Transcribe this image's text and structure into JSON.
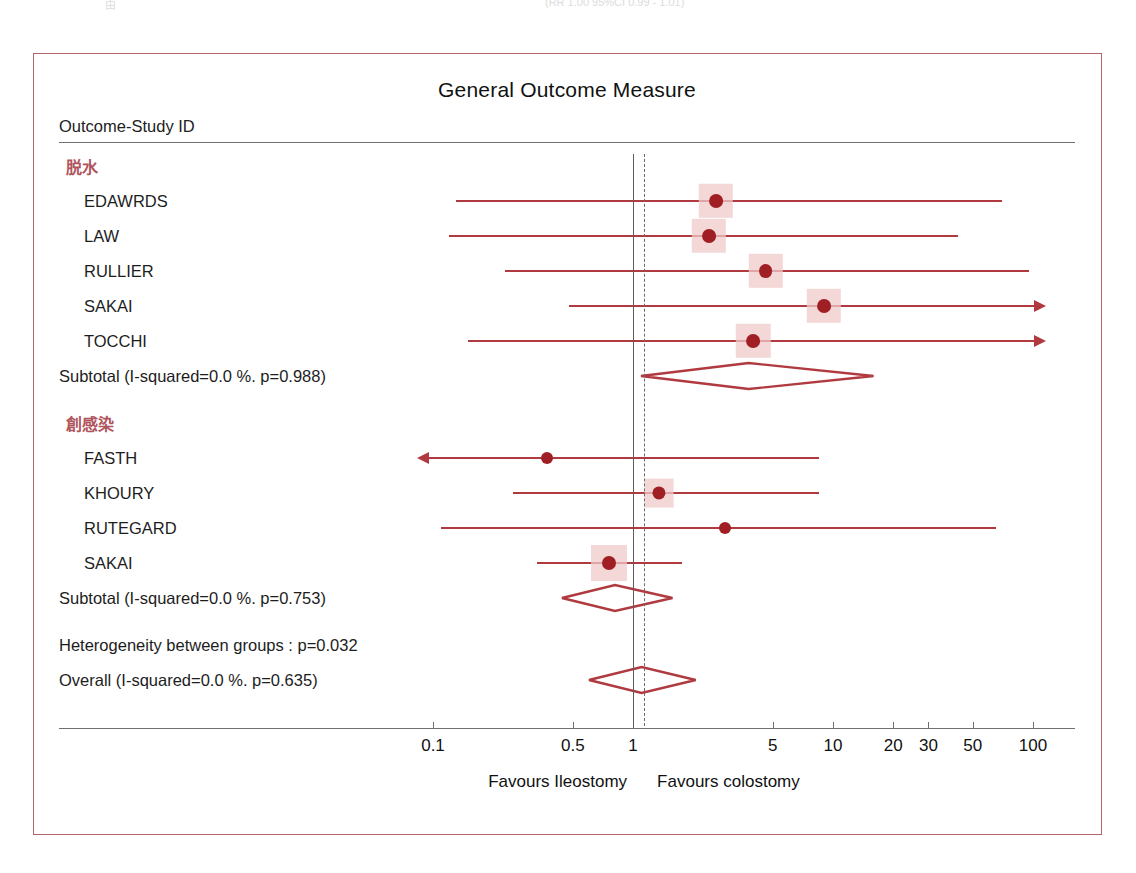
{
  "scan_artifacts": {
    "top_left_fragment": "由",
    "top_right_fragment": "(RR 1.00  95%CI 0.99 - 1.01)"
  },
  "figure": {
    "title": "General Outcome Measure",
    "column_header": "Outcome-Study ID",
    "left_caption": "Favours Ileostomy",
    "right_caption": "Favours colostomy",
    "accent_color": "#b03a3f",
    "group_label_color": "#b0545c",
    "frame_color": "#b5656a",
    "marker_box_color": "#f0c9ca",
    "point_color": "#a01f24"
  },
  "chart_data": {
    "type": "forest",
    "title": "General Outcome Measure",
    "xlabel": "",
    "ylabel": "Outcome-Study ID",
    "xscale": "log",
    "xlim": [
      0.08,
      130
    ],
    "grid": false,
    "null_value": 1,
    "pooled_reference": 1.13,
    "tick_values": [
      0.1,
      0.5,
      1,
      5,
      10,
      20,
      30,
      50,
      100
    ],
    "tick_labels": [
      "0.1",
      "0.5",
      "1",
      "5",
      "10",
      "20",
      "30",
      "50",
      "100"
    ],
    "left_caption": "Favours Ileostomy",
    "right_caption": "Favours colostomy",
    "groups": [
      {
        "label": "脱水",
        "studies": [
          {
            "name": "EDAWRDS",
            "estimate": 2.6,
            "lower": 0.13,
            "upper": 70.0,
            "weight": 0.9,
            "arrow_left": false,
            "arrow_right": false
          },
          {
            "name": "LAW",
            "estimate": 2.4,
            "lower": 0.12,
            "upper": 42.0,
            "weight": 0.9,
            "arrow_left": false,
            "arrow_right": false
          },
          {
            "name": "RULLIER",
            "estimate": 4.6,
            "lower": 0.23,
            "upper": 95.0,
            "weight": 0.9,
            "arrow_left": false,
            "arrow_right": false
          },
          {
            "name": "SAKAI",
            "estimate": 9.0,
            "lower": 0.48,
            "upper": 130.0,
            "weight": 0.9,
            "arrow_left": false,
            "arrow_right": true
          },
          {
            "name": "TOCCHI",
            "estimate": 4.0,
            "lower": 0.15,
            "upper": 130.0,
            "weight": 0.9,
            "arrow_left": false,
            "arrow_right": true
          }
        ],
        "summary": {
          "label": "Subtotal (I-squared=0.0 %.  p=0.988)",
          "i_squared": "0.0 %",
          "p_value": "0.988",
          "estimate": 3.8,
          "lower": 1.1,
          "upper": 16.0
        }
      },
      {
        "label": "創感染",
        "studies": [
          {
            "name": "FASTH",
            "estimate": 0.37,
            "lower": 0.08,
            "upper": 8.5,
            "weight": 0.0,
            "arrow_left": true,
            "arrow_right": false
          },
          {
            "name": "KHOURY",
            "estimate": 1.35,
            "lower": 0.25,
            "upper": 8.5,
            "weight": 0.55,
            "arrow_left": false,
            "arrow_right": false
          },
          {
            "name": "RUTEGARD",
            "estimate": 2.9,
            "lower": 0.11,
            "upper": 65.0,
            "weight": 0.0,
            "arrow_left": false,
            "arrow_right": false
          },
          {
            "name": "SAKAI",
            "estimate": 0.76,
            "lower": 0.33,
            "upper": 1.75,
            "weight": 1.0,
            "arrow_left": false,
            "arrow_right": false
          }
        ],
        "summary": {
          "label": "Subtotal (I-squared=0.0 %.  p=0.753)",
          "i_squared": "0.0 %",
          "p_value": "0.753",
          "estimate": 0.81,
          "lower": 0.44,
          "upper": 1.57
        }
      }
    ],
    "heterogeneity_note": "Heterogeneity between groups : p=0.032",
    "heterogeneity_p": "0.032",
    "overall": {
      "label": "Overall (I-squared=0.0 %.  p=0.635)",
      "i_squared": "0.0 %",
      "p_value": "0.635",
      "estimate": 1.1,
      "lower": 0.6,
      "upper": 2.05
    }
  }
}
